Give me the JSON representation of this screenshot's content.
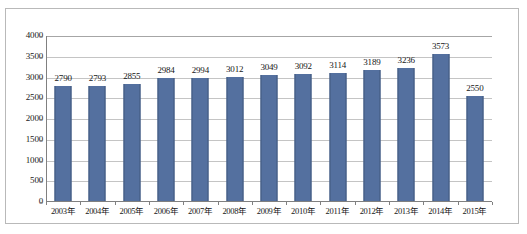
{
  "chart_data": {
    "type": "bar",
    "title": "",
    "subtitle": "",
    "xlabel": "",
    "ylabel": "",
    "categories": [
      "2003年",
      "2004年",
      "2005年",
      "2006年",
      "2007年",
      "2008年",
      "2009年",
      "2010年",
      "2011年",
      "2012年",
      "2013年",
      "2014年",
      "2015年"
    ],
    "values": [
      2790,
      2793,
      2855,
      2984,
      2994,
      3012,
      3049,
      3092,
      3114,
      3189,
      3236,
      3573,
      2550
    ],
    "data_labels": [
      "2790",
      "2793",
      "2855",
      "2984",
      "2994",
      "3012",
      "3049",
      "3092",
      "3114",
      "3189",
      "3236",
      "3573",
      "2550"
    ],
    "ylim": [
      0,
      4000
    ],
    "ytick_values": [
      0,
      500,
      1000,
      1500,
      2000,
      2500,
      3000,
      3500,
      4000
    ],
    "ytick_labels": [
      "0",
      "500",
      "1000",
      "1500",
      "2000",
      "2500",
      "3000",
      "3500",
      "4000"
    ],
    "grid": true,
    "grid_orientation": "horizontal",
    "legend": false,
    "legend_position": "none",
    "series": [
      {
        "name": "",
        "values": [
          2790,
          2793,
          2855,
          2984,
          2994,
          3012,
          3049,
          3092,
          3114,
          3189,
          3236,
          3573,
          2550
        ]
      }
    ],
    "colors": {
      "bar_fill": "#54709f",
      "bar_edge": "#40597f",
      "gridline": "#a6a6a6",
      "axis": "#808080",
      "text": "#161616",
      "frame_border": "#b9b9b9",
      "background": "#ffffff"
    }
  }
}
